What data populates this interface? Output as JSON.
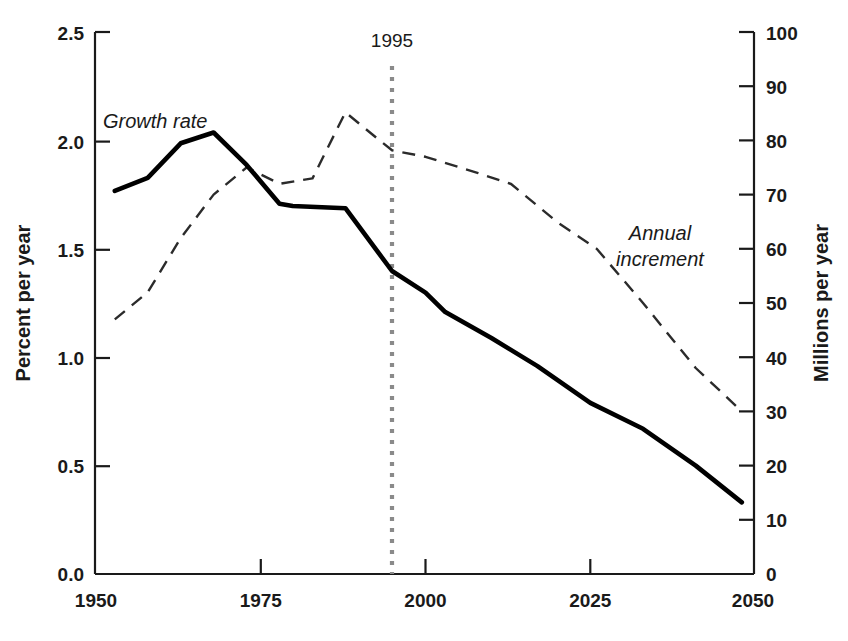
{
  "chart_data": {
    "type": "line",
    "title": "",
    "subtitle": "",
    "xlabel": "",
    "ylabel": "Percent per year",
    "y2label": "Millions per year",
    "xlim": [
      1950,
      2050
    ],
    "ylim": [
      0.0,
      2.5
    ],
    "y2lim": [
      0,
      100
    ],
    "grid": false,
    "legend_position": "inline-annotations",
    "x_ticks": [
      1950,
      1975,
      2000,
      2025,
      2050
    ],
    "x_tick_labels": [
      "1950",
      "1975",
      "2000",
      "2025",
      "2050"
    ],
    "y_ticks": [
      0.0,
      0.5,
      1.0,
      1.5,
      2.0,
      2.5
    ],
    "y_tick_labels": [
      "0.0",
      "0.5",
      "1.0",
      "1.5",
      "2.0",
      "2.5"
    ],
    "y2_ticks": [
      0,
      10,
      20,
      30,
      40,
      50,
      60,
      70,
      80,
      90,
      100
    ],
    "y2_tick_labels": [
      "0",
      "10",
      "20",
      "30",
      "40",
      "50",
      "60",
      "70",
      "80",
      "90",
      "100"
    ],
    "annotations": [
      {
        "name": "growth-rate-label",
        "text": "Growth rate",
        "x": 1957,
        "y": 2.18,
        "style": "italic"
      },
      {
        "name": "annual-increment-label",
        "text": "Annual\nincrement",
        "x": 2026,
        "y": 1.42,
        "style": "italic"
      },
      {
        "name": "year-marker-label",
        "text": "1995",
        "x": 1995,
        "y": 2.45,
        "style": "normal"
      }
    ],
    "markers": [
      {
        "name": "year-1995-divider",
        "type": "vline",
        "x": 1995,
        "label": "1995",
        "color": "#8a8a8a",
        "style": "dotted"
      }
    ],
    "series": [
      {
        "name": "Growth rate",
        "axis": "left",
        "units": "Percent per year",
        "style": "solid",
        "color": "#000000",
        "x": [
          1953,
          1958,
          1963,
          1968,
          1973,
          1978,
          1980,
          1988,
          1995,
          2000,
          2003,
          2010,
          2017,
          2025,
          2033,
          2041,
          2048
        ],
        "values": [
          1.77,
          1.83,
          1.99,
          2.04,
          1.89,
          1.71,
          1.7,
          1.69,
          1.4,
          1.3,
          1.21,
          1.09,
          0.96,
          0.79,
          0.67,
          0.5,
          0.33
        ]
      },
      {
        "name": "Annual increment",
        "axis": "right",
        "units": "Millions per year",
        "style": "dashed",
        "color": "#2b2b2b",
        "x": [
          1953,
          1958,
          1963,
          1968,
          1973,
          1978,
          1983,
          1988,
          1992,
          1995,
          2000,
          2008,
          2013,
          2020,
          2026,
          2033,
          2041,
          2048
        ],
        "values": [
          47,
          52,
          62,
          70,
          75,
          72,
          73,
          86,
          82,
          79,
          78,
          75,
          73,
          69,
          64,
          54,
          42,
          30
        ]
      }
    ]
  },
  "axes": {
    "left_title": "Percent per year",
    "right_title": "Millions per year"
  }
}
